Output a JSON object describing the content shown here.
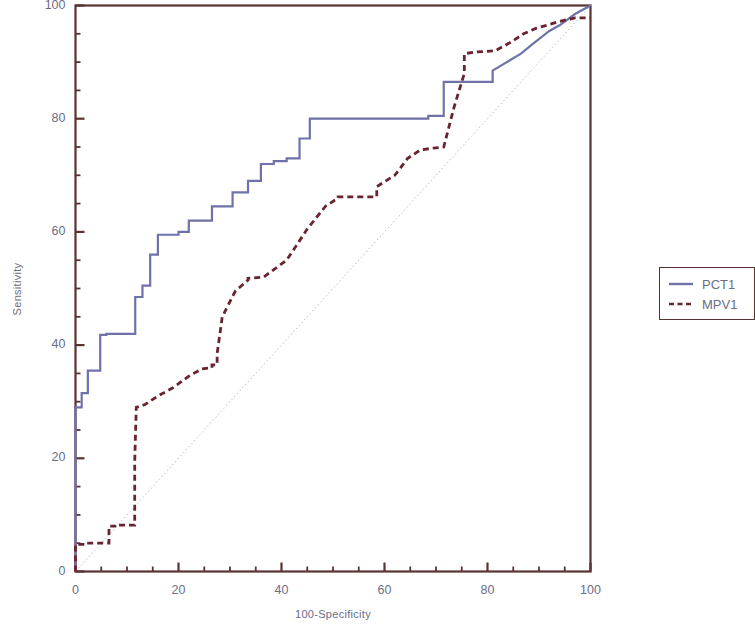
{
  "chart_data": {
    "type": "line",
    "title": "",
    "xlabel": "100-Specificity",
    "ylabel": "Sensitivity",
    "xlim": [
      0,
      100
    ],
    "ylim": [
      0,
      100
    ],
    "xticks": [
      0,
      20,
      40,
      60,
      80,
      100
    ],
    "yticks": [
      0,
      20,
      40,
      60,
      80,
      100
    ],
    "xtick_labels": [
      "0",
      "20",
      "40",
      "60",
      "80",
      "100"
    ],
    "ytick_labels": [
      "0",
      "20",
      "40",
      "60",
      "80",
      "100"
    ],
    "xminor_step": 5,
    "yminor_step": 5,
    "grid": false,
    "legend_position": "right-outside",
    "reference_line": {
      "name": "chance-diagonal",
      "x": [
        0,
        100
      ],
      "y": [
        0,
        100
      ],
      "color": "#b9b9c9",
      "style": "dotted"
    },
    "series": [
      {
        "name": "PCT1",
        "color": "#6f72a8",
        "style": "solid",
        "x": [
          0,
          0,
          1.2,
          1.2,
          2.4,
          2.4,
          4.8,
          4.8,
          6.0,
          6.0,
          11.6,
          11.6,
          13.0,
          13.0,
          14.5,
          14.5,
          16.0,
          16.0,
          20.0,
          20.0,
          22.0,
          22.0,
          26.5,
          26.5,
          30.5,
          30.5,
          33.5,
          33.5,
          36.0,
          36.0,
          38.5,
          38.5,
          41.0,
          41.0,
          43.5,
          43.5,
          45.5,
          45.5,
          68.5,
          68.5,
          71.5,
          71.5,
          81.0,
          81.0,
          86.5,
          88.5,
          92.0,
          94.0,
          97.0,
          100.0
        ],
        "y": [
          0,
          29.0,
          29.0,
          31.5,
          31.5,
          35.5,
          35.5,
          41.8,
          41.8,
          42.0,
          42.0,
          48.5,
          48.5,
          50.5,
          50.5,
          56.0,
          56.0,
          59.5,
          59.5,
          60.0,
          60.0,
          62.0,
          62.0,
          64.5,
          64.5,
          67.0,
          67.0,
          69.0,
          69.0,
          72.0,
          72.0,
          72.5,
          72.5,
          73.0,
          73.0,
          76.5,
          76.5,
          80.0,
          80.0,
          80.5,
          80.5,
          86.5,
          86.5,
          88.5,
          91.5,
          93.0,
          95.5,
          96.5,
          98.5,
          100.0
        ]
      },
      {
        "name": "MPV1",
        "color": "#68242f",
        "style": "dashed",
        "x": [
          0,
          0,
          2.0,
          2.0,
          6.5,
          6.5,
          8.0,
          8.0,
          11.5,
          11.5,
          11.8,
          13.5,
          16.0,
          19.0,
          22.0,
          24.5,
          26.5,
          26.5,
          27.5,
          27.5,
          28.5,
          31.0,
          33.5,
          33.5,
          36.5,
          41.0,
          45.0,
          48.5,
          51.0,
          51.0,
          58.5,
          58.5,
          62.0,
          64.5,
          67.0,
          69.5,
          71.5,
          73.5,
          75.5,
          75.5,
          78.0,
          81.5,
          84.5,
          87.0,
          89.5,
          91.5,
          94.0,
          97.0,
          100.0
        ],
        "y": [
          0,
          4.8,
          4.8,
          5.0,
          5.0,
          8.0,
          8.0,
          8.2,
          8.2,
          19.5,
          29.0,
          29.5,
          31.0,
          32.5,
          34.5,
          35.8,
          36.0,
          36.5,
          36.5,
          38.5,
          45.0,
          49.5,
          51.5,
          51.8,
          52.0,
          55.0,
          60.5,
          64.5,
          66.0,
          66.2,
          66.2,
          68.0,
          70.0,
          73.0,
          74.5,
          74.8,
          75.0,
          82.0,
          88.0,
          91.5,
          91.8,
          92.0,
          93.5,
          95.0,
          96.0,
          96.5,
          97.2,
          97.8,
          97.8
        ]
      }
    ]
  },
  "legend": {
    "items": [
      {
        "label": "PCT1",
        "color": "#6f72a8",
        "style": "solid"
      },
      {
        "label": "MPV1",
        "color": "#68242f",
        "style": "dashed"
      }
    ]
  },
  "axes": {
    "spine_color": "#5a3230",
    "text_color": "#6b6d87"
  }
}
